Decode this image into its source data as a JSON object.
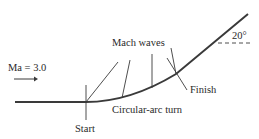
{
  "diagram": {
    "type": "supersonic expansion over circular-arc turn",
    "labels": {
      "mach": "Ma = 3.0",
      "mach_waves": "Mach waves",
      "angle": "20°",
      "finish": "Finish",
      "arc": "Circular-arc turn",
      "start": "Start"
    },
    "values": {
      "mach_number": 3.0,
      "turn_angle_deg": 20
    },
    "colors": {
      "line": "#3a3a3a",
      "text": "#2a2a2a"
    }
  }
}
